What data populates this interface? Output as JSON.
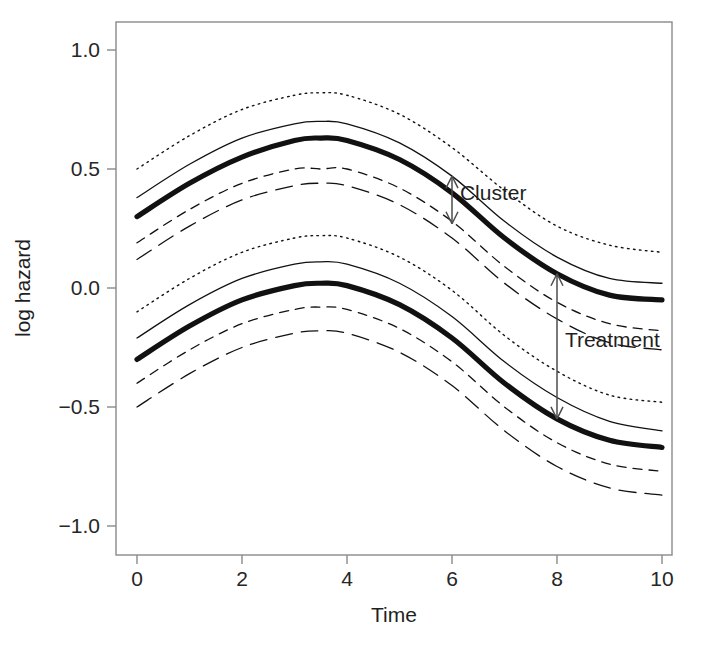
{
  "chart_data": {
    "type": "line",
    "title": "",
    "xlabel": "Time",
    "ylabel": "log hazard",
    "xlim": [
      0,
      10
    ],
    "ylim": [
      -1.0,
      1.0
    ],
    "grid": false,
    "legend": "none",
    "xticks": [
      0,
      2,
      4,
      6,
      8,
      10
    ],
    "xtick_labels": [
      "0",
      "2",
      "4",
      "6",
      "8",
      "10"
    ],
    "yticks": [
      -1.0,
      -0.5,
      0.0,
      0.5,
      1.0
    ],
    "ytick_labels": [
      "-1.0",
      "-0.5",
      "0.0",
      "0.5",
      "1.0"
    ],
    "x": [
      0,
      1,
      2,
      3,
      3.5,
      4,
      5,
      6,
      7,
      8,
      9,
      10
    ],
    "series": [
      {
        "name": "upper-group-outer-upper-dotted",
        "group": "upper",
        "style": "dotted",
        "values": [
          0.5,
          0.64,
          0.75,
          0.81,
          0.82,
          0.81,
          0.73,
          0.59,
          0.41,
          0.26,
          0.18,
          0.15
        ]
      },
      {
        "name": "upper-group-inner-upper-solid",
        "group": "upper",
        "style": "solid-thin",
        "values": [
          0.38,
          0.52,
          0.63,
          0.69,
          0.7,
          0.69,
          0.61,
          0.47,
          0.28,
          0.13,
          0.04,
          0.02
        ]
      },
      {
        "name": "upper-group-mean-bold",
        "group": "upper",
        "style": "solid-bold",
        "values": [
          0.3,
          0.44,
          0.55,
          0.62,
          0.63,
          0.62,
          0.54,
          0.4,
          0.21,
          0.06,
          -0.03,
          -0.05
        ]
      },
      {
        "name": "upper-group-inner-lower-dashed",
        "group": "upper",
        "style": "dashed",
        "values": [
          0.19,
          0.33,
          0.44,
          0.5,
          0.5,
          0.5,
          0.42,
          0.28,
          0.09,
          -0.06,
          -0.15,
          -0.18
        ]
      },
      {
        "name": "upper-group-outer-lower-longdash",
        "group": "upper",
        "style": "longdash",
        "values": [
          0.12,
          0.26,
          0.37,
          0.43,
          0.44,
          0.43,
          0.35,
          0.21,
          0.02,
          -0.13,
          -0.23,
          -0.26
        ]
      },
      {
        "name": "lower-group-outer-upper-dotted",
        "group": "lower",
        "style": "dotted",
        "values": [
          -0.1,
          0.04,
          0.15,
          0.21,
          0.22,
          0.21,
          0.13,
          -0.01,
          -0.2,
          -0.35,
          -0.45,
          -0.48
        ]
      },
      {
        "name": "lower-group-inner-upper-solid",
        "group": "lower",
        "style": "solid-thin",
        "values": [
          -0.21,
          -0.07,
          0.04,
          0.1,
          0.11,
          0.1,
          0.02,
          -0.12,
          -0.31,
          -0.46,
          -0.56,
          -0.6
        ]
      },
      {
        "name": "lower-group-mean-bold",
        "group": "lower",
        "style": "solid-bold",
        "values": [
          -0.3,
          -0.16,
          -0.05,
          0.01,
          0.02,
          0.01,
          -0.07,
          -0.21,
          -0.4,
          -0.55,
          -0.64,
          -0.67
        ]
      },
      {
        "name": "lower-group-inner-lower-dashed",
        "group": "lower",
        "style": "dashed",
        "values": [
          -0.4,
          -0.26,
          -0.15,
          -0.09,
          -0.08,
          -0.09,
          -0.17,
          -0.31,
          -0.5,
          -0.65,
          -0.74,
          -0.77
        ]
      },
      {
        "name": "lower-group-outer-lower-longdash",
        "group": "lower",
        "style": "longdash",
        "values": [
          -0.5,
          -0.36,
          -0.25,
          -0.19,
          -0.18,
          -0.19,
          -0.27,
          -0.41,
          -0.6,
          -0.75,
          -0.84,
          -0.87
        ]
      }
    ],
    "annotations": [
      {
        "label": "Cluster",
        "type": "double-arrow-vertical",
        "x": 6.0,
        "y_top": 0.47,
        "y_bottom": 0.27,
        "label_x": 6.15,
        "label_y": 0.4
      },
      {
        "label": "Treatment",
        "type": "double-arrow-vertical",
        "x": 8.0,
        "y_top": 0.06,
        "y_bottom": -0.55,
        "label_x": 8.15,
        "label_y": -0.22
      }
    ]
  },
  "axes": {
    "x_title": "Time",
    "y_title": "log hazard"
  },
  "colors": {
    "curve": "#111111",
    "axis": "#8a8a8a",
    "text": "#1f1f1f",
    "background": "#ffffff",
    "annotation_arrow": "#4d4d4d"
  }
}
